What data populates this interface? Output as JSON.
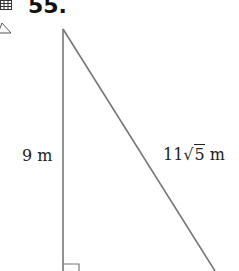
{
  "problem": {
    "number": "55.",
    "icons": [
      "grid-icon",
      "triangle-icon"
    ]
  },
  "diagram": {
    "type": "right-triangle",
    "vertical_leg_label": "9 m",
    "hypotenuse_label": {
      "coefficient": "11",
      "radical_symbol": "√",
      "radicand": "5",
      "unit": "m"
    },
    "right_angle_marker": "bottom-left",
    "stroke_color": "#777777"
  }
}
